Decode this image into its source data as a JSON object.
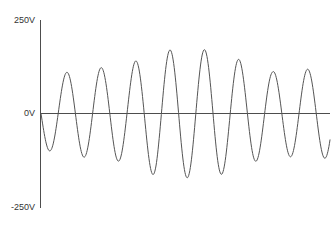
{
  "chart_data": {
    "type": "line",
    "title": "",
    "subtitle": "",
    "xlabel": "",
    "ylabel": "",
    "unit": "V",
    "grid": false,
    "legend": null,
    "legend_position": "none",
    "y_axis": {
      "min": -250,
      "max": 250,
      "ticks": [
        250,
        0,
        -250
      ],
      "tick_labels": [
        "250V",
        "0V",
        "-250V"
      ],
      "zero_line": true
    },
    "x_axis": {
      "min": 0,
      "max": 8.4,
      "ticks": [],
      "tick_labels": [],
      "visible_line": false
    },
    "series": [
      {
        "name": "voltage",
        "color": "#555555",
        "line_width": 1,
        "cycles": 8.4,
        "samples_per_cycle": 64,
        "phase_deg": 180,
        "peak_amplitudes": [
          110,
          120,
          125,
          168,
          172,
          170,
          112,
          118
        ],
        "trough_amplitudes": [
          -112,
          -120,
          -122,
          -168,
          -170,
          -166,
          -110,
          -115
        ],
        "amplitude_envelope": [
          95,
          112,
          122,
          130,
          168,
          172,
          170,
          140,
          112,
          118,
          120
        ],
        "points_x": [
          0.0,
          0.5,
          1.0,
          1.5,
          2.0,
          2.5,
          3.0,
          3.5,
          4.0,
          4.5,
          5.0,
          5.5,
          6.0,
          6.5,
          7.0,
          7.5,
          8.0,
          8.4
        ],
        "points_y": [
          0,
          -112,
          0,
          110,
          0,
          -120,
          0,
          120,
          0,
          -122,
          0,
          125,
          0,
          -168,
          0,
          168,
          0,
          -120
        ]
      }
    ]
  },
  "axis_labels": {
    "top": "250V",
    "zero": "0V",
    "bottom": "-250V"
  },
  "colors": {
    "background": "#ffffff",
    "axis": "#4d4d4d",
    "trace": "#555555",
    "text": "#333333"
  }
}
